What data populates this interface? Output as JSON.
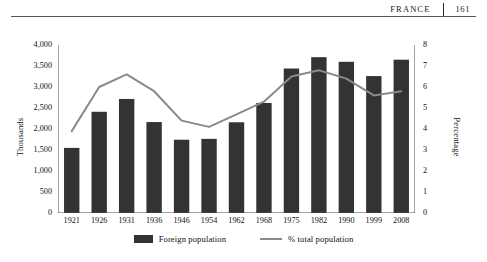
{
  "running_head": {
    "title": "FRANCE",
    "page_number": "161"
  },
  "chart_data": {
    "type": "bar",
    "title": "",
    "xlabel": "",
    "ylabel": "Thousands",
    "y2label": "Percentage",
    "categories": [
      "1921",
      "1926",
      "1931",
      "1936",
      "1946",
      "1954",
      "1962",
      "1968",
      "1975",
      "1982",
      "1990",
      "1999",
      "2008"
    ],
    "series": [
      {
        "name": "Foreign population",
        "type": "bar",
        "axis": "left",
        "color": "#333333",
        "values": [
          1550,
          2410,
          2715,
          2165,
          1745,
          1765,
          2160,
          2620,
          3440,
          3710,
          3600,
          3260,
          3650
        ]
      },
      {
        "name": "% total population",
        "type": "line",
        "axis": "right",
        "color": "#8a8a8a",
        "values": [
          3.9,
          6.0,
          6.6,
          5.8,
          4.4,
          4.1,
          4.7,
          5.3,
          6.5,
          6.8,
          6.4,
          5.6,
          5.8
        ]
      }
    ],
    "ylim": [
      0,
      4000
    ],
    "yticks": [
      "0",
      "500",
      "1,000",
      "1,500",
      "2,000",
      "2,500",
      "3,000",
      "3,500",
      "4,000"
    ],
    "y2lim": [
      0,
      8
    ],
    "y2ticks": [
      "0",
      "1",
      "2",
      "3",
      "4",
      "5",
      "6",
      "7",
      "8"
    ],
    "grid": false,
    "legend_position": "bottom",
    "legend": [
      "Foreign population",
      "% total population"
    ]
  }
}
